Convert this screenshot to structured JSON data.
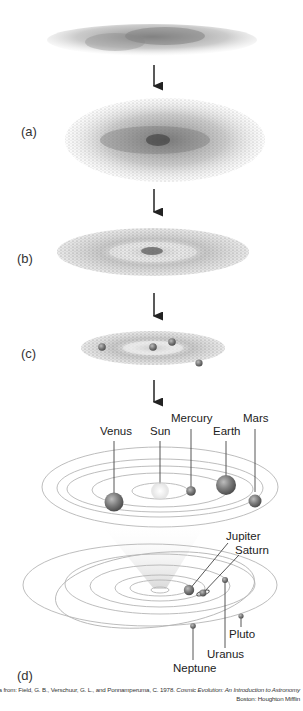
{
  "figure": {
    "stages": [
      {
        "id": "cloud",
        "label": ""
      },
      {
        "id": "a",
        "label": "(a)"
      },
      {
        "id": "b",
        "label": "(b)"
      },
      {
        "id": "c",
        "label": "(c)"
      },
      {
        "id": "d",
        "label": "(d)"
      }
    ],
    "inner_planets": [
      {
        "name": "Venus"
      },
      {
        "name": "Sun"
      },
      {
        "name": "Mercury"
      },
      {
        "name": "Earth"
      },
      {
        "name": "Mars"
      }
    ],
    "outer_planets": [
      {
        "name": "Jupiter"
      },
      {
        "name": "Saturn"
      },
      {
        "name": "Uranus"
      },
      {
        "name": "Pluto"
      },
      {
        "name": "Neptune"
      }
    ],
    "credit": {
      "line1_prefix": "Data from: Field, G. B., Verschuur, G. L., and Ponnamperuma, C. 1978. ",
      "line1_title": "Cosmic Evolution: An Introduction to Astronomy",
      "line2": "Boston: Houghton Mifflin"
    },
    "colors": {
      "dust": "#8a8a8a",
      "planet": "#7a7a7a",
      "orbit": "#b5b5b5",
      "arrow": "#222222"
    }
  }
}
